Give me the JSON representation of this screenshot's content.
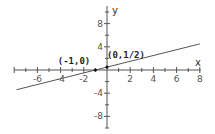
{
  "chart_data": {
    "type": "line",
    "title": "",
    "xlabel": "x",
    "ylabel": "y",
    "xlim": [
      -8,
      8
    ],
    "ylim": [
      -10,
      10
    ],
    "grid": false,
    "x_ticks": [
      -6,
      -4,
      -2,
      2,
      4,
      6,
      8
    ],
    "y_ticks": [
      8,
      4,
      -4,
      -8
    ],
    "x_tick_labels": [
      "-6",
      "-4",
      "-2",
      "2",
      "4",
      "6",
      "8"
    ],
    "y_tick_labels": [
      "8",
      "4",
      "-4",
      "-8"
    ],
    "series": [
      {
        "name": "y = x/2 + 1/2",
        "equation": "y = 0.5x + 0.5",
        "x": [
          -7.8,
          8
        ],
        "y": [
          -3.4,
          4.5
        ],
        "color": "#555555"
      }
    ],
    "points": [
      {
        "x": -1,
        "y": 0,
        "label": "(-1,0)"
      },
      {
        "x": 0,
        "y": 0.5,
        "label": "(0,1/2)"
      }
    ]
  }
}
